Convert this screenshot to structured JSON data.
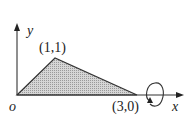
{
  "diagram": {
    "type": "region-rotation",
    "axes": {
      "x_label": "x",
      "y_label": "y",
      "origin_label": "o"
    },
    "vertices": [
      {
        "label": "(1,1)",
        "x": 1,
        "y": 1
      },
      {
        "label": "(3,0)",
        "x": 3,
        "y": 0
      }
    ],
    "region": {
      "shape": "triangle",
      "points": [
        [
          0,
          0
        ],
        [
          1,
          1
        ],
        [
          3,
          0
        ]
      ],
      "fill": "#c8c8c8",
      "stroke": "#333333"
    },
    "rotation": {
      "axis": "x",
      "symbol": "rotation-arrow-around-x-axis"
    }
  }
}
